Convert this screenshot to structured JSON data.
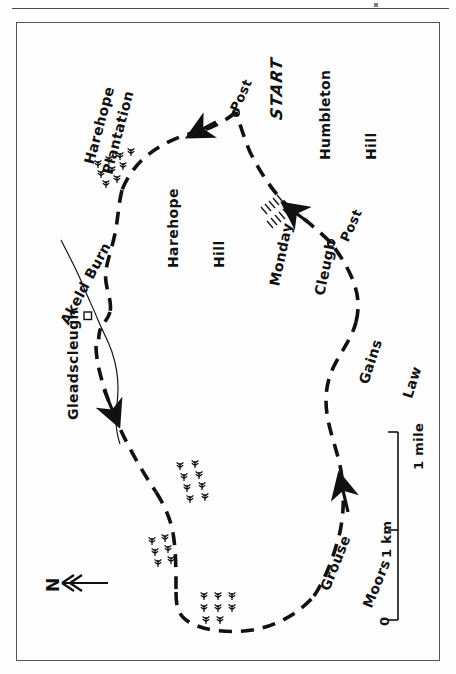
{
  "map": {
    "title_note": "hand-drawn walking route map, rotated 90 degrees",
    "frame_color": "#555555",
    "ink_color": "#111111",
    "background": "#fdfdfd"
  },
  "labels": {
    "start": "START",
    "humbleton_hill": "Humbleton\nHill",
    "humbleton_hill_l1": "Humbleton",
    "humbleton_hill_l2": "Hill",
    "post_north": "Post",
    "post_east": "Post",
    "harehope_plantation_l1": "Harehope",
    "harehope_plantation_l2": "Plantation",
    "harehope_hill_l1": "Harehope",
    "harehope_hill_l2": "Hill",
    "monday_cleugh_l1": "Monday",
    "monday_cleugh_l2": "Cleugh",
    "gains_law_l1": "Gains",
    "gains_law_l2": "Law",
    "grouse_moors_l1": "Grouse",
    "grouse_moors_l2": "Moors",
    "gleadscleugh": "Gleadscleugh",
    "akeld_burn": "Akeld Burn",
    "north": "N"
  },
  "scale_bar": {
    "zero": "0",
    "km": "1 km",
    "mile": "1 mile"
  },
  "symbols": {
    "post_marker": "circle-marker",
    "building_marker": "square-building-symbol",
    "tree_marker": "conifer-tree-symbol",
    "crag_marker": "cliff-hatching-symbol",
    "route_style": "dashed-line",
    "stream_style": "wavy-thin-line",
    "direction_arrow": "arrowhead"
  },
  "features": {
    "route_arrows": 4,
    "post_markers": 2,
    "tree_groups": 4,
    "crag_hatch_groups": 2
  }
}
